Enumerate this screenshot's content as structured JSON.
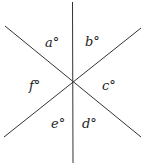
{
  "diagram": {
    "angles": [
      {
        "id": "a",
        "label": "a°"
      },
      {
        "id": "b",
        "label": "b°"
      },
      {
        "id": "c",
        "label": "c°"
      },
      {
        "id": "d",
        "label": "d°"
      },
      {
        "id": "e",
        "label": "e°"
      },
      {
        "id": "f",
        "label": "f°"
      }
    ],
    "line_color": "#333333"
  }
}
